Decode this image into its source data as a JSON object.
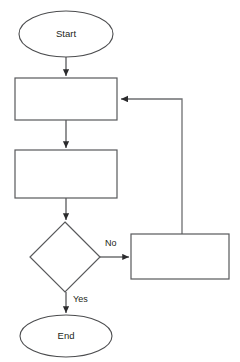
{
  "diagram": {
    "type": "flowchart",
    "background_color": "#ffffff",
    "stroke_color": "#58595b",
    "text_color": "#231f20",
    "nodes": [
      {
        "id": "start",
        "shape": "ellipse",
        "label": "Start",
        "cx": 66,
        "cy": 34,
        "rx": 47,
        "ry": 23
      },
      {
        "id": "process-1",
        "shape": "rectangle",
        "label": "",
        "x": 15,
        "y": 78,
        "width": 102,
        "height": 42
      },
      {
        "id": "process-2",
        "shape": "rectangle",
        "label": "",
        "x": 15,
        "y": 150,
        "width": 102,
        "height": 48
      },
      {
        "id": "decision",
        "shape": "diamond",
        "label": "",
        "cx": 65,
        "cy": 257,
        "half_width": 35,
        "half_height": 35
      },
      {
        "id": "process-3",
        "shape": "rectangle",
        "label": "",
        "x": 131,
        "y": 234,
        "width": 98,
        "height": 45
      },
      {
        "id": "end",
        "shape": "ellipse",
        "label": "End",
        "cx": 66,
        "cy": 336,
        "rx": 46,
        "ry": 21
      }
    ],
    "edges": [
      {
        "id": "start-to-process-1",
        "from": "start",
        "to": "process-1",
        "label": "",
        "arrow": true
      },
      {
        "id": "process-1-to-process-2",
        "from": "process-1",
        "to": "process-2",
        "label": "",
        "arrow": true
      },
      {
        "id": "process-2-to-decision",
        "from": "process-2",
        "to": "decision",
        "label": "",
        "arrow": true
      },
      {
        "id": "decision-to-process-3",
        "from": "decision",
        "to": "process-3",
        "label": "No",
        "label_x": 105,
        "label_y": 244,
        "arrow": true
      },
      {
        "id": "decision-to-end",
        "from": "decision",
        "to": "end",
        "label": "Yes",
        "label_x": 73,
        "label_y": 300,
        "arrow": true
      },
      {
        "id": "process-3-loop-to-process-1",
        "from": "process-3",
        "to": "process-1",
        "label": "",
        "arrow": true
      }
    ]
  }
}
